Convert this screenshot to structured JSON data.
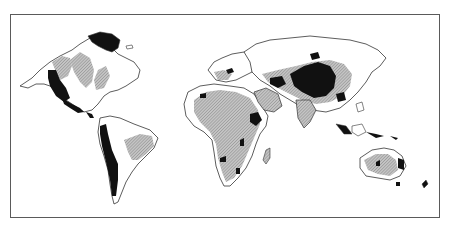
{
  "map": {
    "type": "world-thematic-map",
    "projection": "cylindrical, Pacific-split",
    "frame": {
      "x": 10,
      "y": 14,
      "width": 430,
      "height": 204,
      "stroke": "#5a5a5a"
    },
    "legend_classes": [
      {
        "name": "high",
        "fill": "#111111"
      },
      {
        "name": "medium",
        "fill": "hatched-gray"
      },
      {
        "name": "low",
        "fill": "#ffffff"
      }
    ],
    "colors": {
      "land_outline": "#333333",
      "hatch": "#9a9a9a",
      "dark": "#111111",
      "background": "#ffffff"
    },
    "regions": [
      "North America",
      "Greenland",
      "South America",
      "Europe",
      "Africa",
      "Madagascar",
      "Asia",
      "Southeast Asia",
      "Australia",
      "New Zealand"
    ]
  }
}
